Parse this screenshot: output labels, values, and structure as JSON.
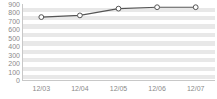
{
  "chart_data": {
    "type": "line",
    "title": "",
    "subtitle": "",
    "xlabel": "",
    "ylabel": "",
    "categories": [
      "12/03",
      "12/04",
      "12/05",
      "12/06",
      "12/07"
    ],
    "values": [
      745,
      765,
      845,
      862,
      862
    ],
    "series": [
      {
        "name": "",
        "values": [
          745,
          765,
          845,
          862,
          862
        ]
      }
    ],
    "ylim": [
      0,
      900
    ],
    "ytick_labels": [
      "900",
      "800",
      "700",
      "600",
      "500",
      "400",
      "300",
      "200",
      "100",
      "0"
    ],
    "ytick_values": [
      900,
      800,
      700,
      600,
      500,
      400,
      300,
      200,
      100,
      0
    ],
    "grid": true,
    "grid_style": "alternating-horizontal-bands",
    "legend": false,
    "legend_position": "none",
    "marker": "open-circle",
    "line_color": "#555555",
    "marker_fill": "#ffffff",
    "marker_stroke": "#555555",
    "band_color": "#e8e8e8",
    "plot_background": "#ffffff",
    "tick_label_color": "#8a8a8a",
    "axis_color": "#c8c8c8"
  }
}
